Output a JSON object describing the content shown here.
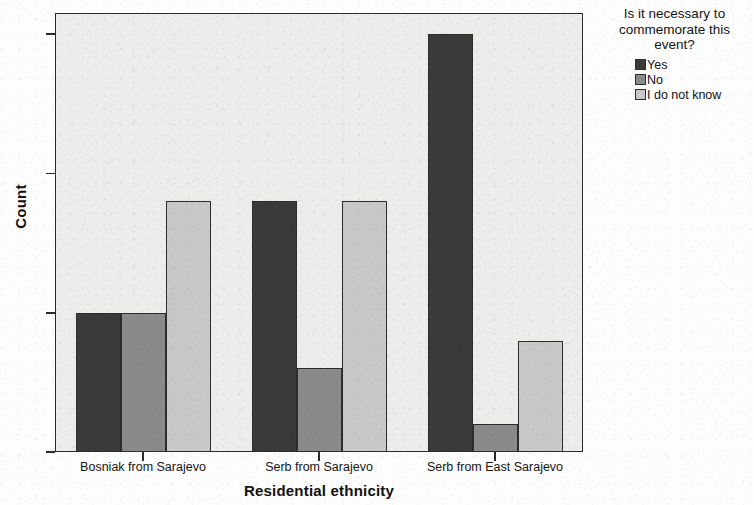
{
  "chart_data": {
    "type": "bar",
    "title": "",
    "xlabel": "Residential ethnicity",
    "ylabel": "Count",
    "categories": [
      "Bosniak from Sarajevo",
      "Serb from Sarajevo",
      "Serb from East Sarajevo"
    ],
    "series": [
      {
        "name": "Yes",
        "values": [
          5,
          9,
          15
        ],
        "color": "#3a3a3a"
      },
      {
        "name": "No",
        "values": [
          5,
          3,
          1
        ],
        "color": "#8a8a8a"
      },
      {
        "name": "I do not know",
        "values": [
          9,
          9,
          4
        ],
        "color": "#c8c8c8"
      }
    ],
    "ylim": [
      0,
      16
    ],
    "yticks": [
      0,
      5,
      10,
      15
    ],
    "ytick_labels": [
      "0",
      "5",
      "10",
      "15"
    ],
    "grid": false,
    "legend_position": "right",
    "legend_title": "Is it necessary to commemorate this event?",
    "legend_title_lines": [
      "Is it necessary to",
      "commemorate this",
      "event?"
    ],
    "plot_background": "#ececeb",
    "axis_color": "#2a2a2a",
    "bar_border_color": "#2d2d2d"
  },
  "axes": {
    "y_title": "Count",
    "x_title": "Residential ethnicity"
  }
}
